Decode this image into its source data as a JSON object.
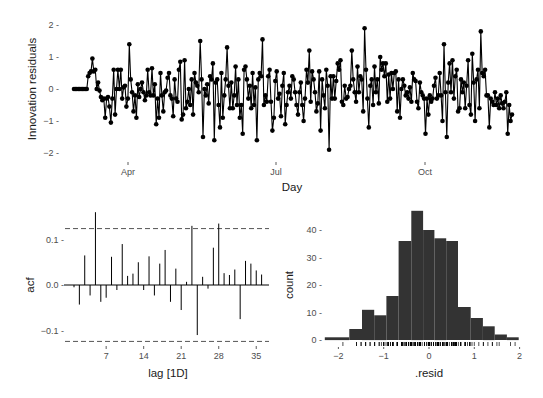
{
  "chart_data": [
    {
      "type": "line",
      "title": "",
      "xlabel": "Day",
      "ylabel": "Innovation residuals",
      "x_ticks": [
        {
          "label": "Apr",
          "px": 128
        },
        {
          "label": "Jul",
          "px": 276
        },
        {
          "label": "Oct",
          "px": 425
        }
      ],
      "y_ticks": [
        {
          "label": "2 -",
          "value": 2
        },
        {
          "label": "1 -",
          "value": 1
        },
        {
          "label": "0 -",
          "value": 0
        },
        {
          "label": "−1 -",
          "value": -1
        },
        {
          "label": "−2 -",
          "value": -2
        }
      ],
      "ylim": [
        -2.2,
        2.2
      ],
      "grid": false,
      "marker": "filled-circle",
      "line_color": "#000000",
      "values": [
        0,
        0,
        0,
        0,
        0,
        0,
        0,
        0,
        0,
        0,
        0.4,
        0.5,
        0.55,
        0.95,
        0.55,
        0.6,
        0,
        0.2,
        -0.05,
        -0.25,
        -0.35,
        -0.3,
        -0.9,
        -0.3,
        -0.25,
        -0.55,
        -1.05,
        -0.3,
        0.6,
        -0.8,
        0,
        0.6,
        0,
        0.6,
        -0.3,
        0.05,
        0.1,
        -0.55,
        -0.3,
        1.4,
        0.3,
        -0.1,
        -0.7,
        -0.2,
        -0.9,
        0.15,
        -0.25,
        0,
        0.2,
        -0.1,
        -0.35,
        -0.2,
        0.6,
        -0.1,
        -0.2,
        0.65,
        -0.2,
        0.15,
        -1.1,
        -0.3,
        -0.9,
        0.5,
        -0.2,
        -0.7,
        -0.1,
        -0.05,
        0.35,
        0.5,
        -0.2,
        -0.3,
        -0.85,
        0.3,
        -0.3,
        -0.4,
        0.6,
        0.85,
        -0.95,
        -0.8,
        0.9,
        -0.6,
        -0.4,
        0,
        -0.5,
        0.3,
        -0.8,
        0.5,
        0.2,
        0.1,
        -0.1,
        1.5,
        0.3,
        -1.5,
        0,
        -0.2,
        0.15,
        -0.45,
        0.4,
        0.3,
        0.8,
        -1.6,
        0.2,
        0.3,
        -0.5,
        -1.2,
        0.5,
        -0.9,
        -0.2,
        0.3,
        1.3,
        0.1,
        -0.6,
        0.2,
        -0.6,
        -0.2,
        0.7,
        -0.5,
        0.3,
        -0.9,
        -0.5,
        -1.4,
        0.6,
        0.7,
        0.3,
        -0.3,
        0.1,
        -0.6,
        0.5,
        -0.5,
        0.05,
        -1.6,
        0.3,
        0.5,
        0.4,
        1.55,
        -0.5,
        -0.2,
        -0.4,
        0.4,
        0.6,
        -0.4,
        -1.3,
        -0.9,
        0.25,
        0.55,
        -0.3,
        -0.15,
        -0.85,
        0.1,
        0.5,
        -1.1,
        -0.5,
        -0.1,
        0.1,
        -0.3,
        0.4,
        0.3,
        -0.1,
        -0.5,
        -0.8,
        -0.1,
        0.2,
        -0.5,
        -1.0,
        -0.3,
        0.6,
        0.2,
        1.2,
        -0.4,
        0.55,
        0.3,
        -0.1,
        -0.7,
        -0.45,
        0.55,
        -1.3,
        0.3,
        -0.2,
        -0.6,
        0.6,
        0.1,
        -1.9,
        0.4,
        -0.3,
        0.4,
        -0.3,
        0.25,
        0.8,
        0.6,
        0.9,
        -0.4,
        -0.5,
        0.1,
        -0.3,
        -0.25,
        0,
        0.1,
        1.2,
        0.3,
        -0.1,
        -0.4,
        0.7,
        -0.1,
        0.4,
        0.3,
        -0.7,
        1.9,
        0.6,
        -0.3,
        -1.2,
        0.1,
        0.3,
        -0.5,
        0.7,
        -0.1,
        0.3,
        -0.45,
        1.0,
        0.6,
        0.8,
        0.4,
        0.8,
        -0.4,
        0.45,
        -0.3,
        0.5,
        0,
        0.5,
        0.55,
        -0.7,
        0.3,
        -0.9,
        0,
        0.3,
        0.1,
        -0.2,
        -0.1,
        -0.3,
        0.05,
        -0.4,
        0.5,
        0.3,
        0.25,
        -0.4,
        -0.6,
        0.2,
        -0.1,
        -0.2,
        -0.3,
        -1.4,
        -0.3,
        -0.8,
        -0.2,
        -0.4,
        -0.3,
        0.1,
        0.35,
        -0.3,
        -0.2,
        0.5,
        -0.2,
        -1.0,
        1.4,
        -0.1,
        -1.5,
        0.2,
        0.8,
        -0.1,
        0.9,
        -0.3,
        0.4,
        0.6,
        -0.7,
        -0.6,
        0.3,
        -0.1,
        0.2,
        -0.6,
        0.1,
        0.9,
        -0.5,
        -0.8,
        1.1,
        0.2,
        -1.0,
        0.3,
        0.6,
        -0.6,
        1.8,
        0.5,
        0.4,
        0.6,
        -0.2,
        -0.2,
        -1.2,
        -0.3,
        -0.4,
        -0.5,
        -0.1,
        -0.5,
        -0.3,
        -0.6,
        -0.2,
        -0.45,
        -0.6,
        -0.4,
        -0.1,
        -1.4,
        -0.5,
        -1.0,
        -0.8
      ]
    },
    {
      "type": "bar",
      "subtype": "acf",
      "title": "",
      "xlabel": "lag [1D]",
      "ylabel": "acf",
      "categories": [
        1,
        2,
        3,
        4,
        5,
        6,
        7,
        8,
        9,
        10,
        11,
        12,
        13,
        14,
        15,
        16,
        17,
        18,
        19,
        20,
        21,
        22,
        23,
        24,
        25,
        26,
        27,
        28,
        29,
        30,
        31,
        32,
        33,
        34,
        35,
        36
      ],
      "values": [
        -0.005,
        -0.043,
        0.065,
        -0.023,
        0.16,
        -0.037,
        -0.028,
        0.062,
        -0.011,
        0.09,
        0.02,
        0.025,
        0.05,
        -0.011,
        0.063,
        -0.023,
        0.047,
        0.077,
        -0.037,
        0.036,
        -0.055,
        0.007,
        0.13,
        -0.11,
        0.018,
        -0.008,
        0.082,
        0.135,
        0.026,
        0.022,
        0.034,
        -0.075,
        0.053,
        0.047,
        0.032,
        0.023
      ],
      "confidence_bound": 0.124,
      "x_ticks": [
        7,
        14,
        21,
        28,
        35
      ],
      "y_ticks": [
        {
          "label": "0.1 -",
          "value": 0.1
        },
        {
          "label": "0.0 -",
          "value": 0.0
        },
        {
          "label": "−0.1 -",
          "value": -0.1
        }
      ],
      "ylim": [
        -0.13,
        0.17
      ],
      "grid": false
    },
    {
      "type": "bar",
      "subtype": "histogram",
      "title": "",
      "xlabel": ".resid",
      "ylabel": "count",
      "bin_edges": [
        -2.3,
        -2.03,
        -1.76,
        -1.48,
        -1.21,
        -0.94,
        -0.67,
        -0.39,
        -0.13,
        0.12,
        0.38,
        0.64,
        0.92,
        1.19,
        1.45,
        1.72,
        1.98
      ],
      "values": [
        1,
        1,
        4,
        11,
        9,
        16,
        36,
        47,
        40,
        37,
        36,
        12,
        8,
        5,
        2,
        1
      ],
      "x_ticks": [
        {
          "label": "−2",
          "value": -2
        },
        {
          "label": "−1",
          "value": -1
        },
        {
          "label": "0",
          "value": 0
        },
        {
          "label": "1",
          "value": 1
        },
        {
          "label": "2",
          "value": 2
        }
      ],
      "y_ticks": [
        {
          "label": "40 -",
          "value": 40
        },
        {
          "label": "30 -",
          "value": 30
        },
        {
          "label": "20 -",
          "value": 20
        },
        {
          "label": "10 -",
          "value": 10
        },
        {
          "label": "0 -",
          "value": 0
        }
      ],
      "ylim": [
        0,
        48
      ],
      "bar_color": "#333333",
      "rug": true,
      "grid": false
    }
  ],
  "colors": {
    "ink": "#000000",
    "bar": "#333333",
    "dashed": "#555555",
    "tick_text": "#4d4d4d",
    "axis_title": "#1a1a1a"
  }
}
